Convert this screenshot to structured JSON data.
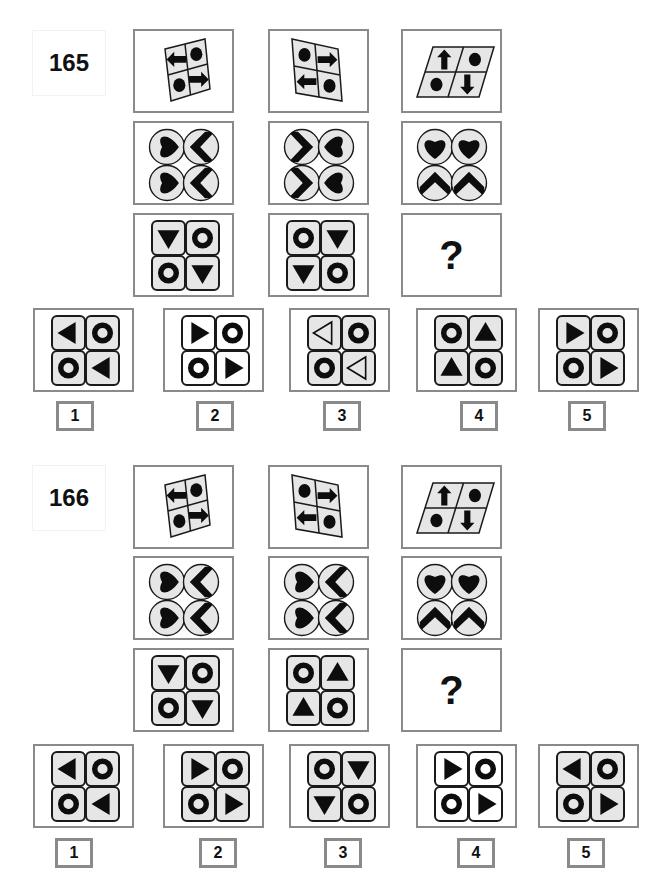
{
  "colors": {
    "frame_border": "#8a8a8a",
    "tile_fill_gray": "#e6e6e6",
    "tile_fill_white": "#ffffff",
    "shape_fill": "#0d0d0d",
    "outline": "#1a1a1a"
  },
  "puzzles": [
    {
      "number": "165",
      "question_mark": "?",
      "grid": [
        [
          {
            "type": "parallelogram-grid",
            "skew": "left-tilt",
            "cells": [
              "arrow-left",
              "dot",
              "dot",
              "arrow-right"
            ]
          },
          {
            "type": "parallelogram-grid",
            "skew": "right-tilt",
            "cells": [
              "dot",
              "arrow-right",
              "arrow-left",
              "dot"
            ]
          },
          {
            "type": "parallelogram-grid",
            "skew": "slant",
            "cells": [
              "arrow-up",
              "dot",
              "dot",
              "arrow-down"
            ]
          }
        ],
        [
          {
            "type": "circle-grid",
            "cells": [
              "heart-right",
              "chevron-left",
              "heart-right",
              "chevron-left"
            ]
          },
          {
            "type": "circle-grid",
            "cells": [
              "chevron-right",
              "heart-left",
              "chevron-right",
              "heart-left"
            ]
          },
          {
            "type": "circle-grid",
            "cells": [
              "heart-up",
              "heart-up",
              "chevron-up",
              "chevron-up"
            ]
          }
        ],
        [
          {
            "type": "tile-grid",
            "fill": "gray",
            "cells": [
              "tri-down",
              "ring",
              "ring",
              "tri-down"
            ]
          },
          {
            "type": "tile-grid",
            "fill": "gray",
            "cells": [
              "ring",
              "tri-down",
              "tri-down",
              "ring"
            ]
          },
          {
            "type": "question"
          }
        ]
      ],
      "options": [
        {
          "label": "1",
          "fill": "gray",
          "cells": [
            "tri-left",
            "ring",
            "ring",
            "tri-left"
          ]
        },
        {
          "label": "2",
          "fill": "white",
          "cells": [
            "tri-right",
            "ring",
            "ring",
            "tri-right"
          ]
        },
        {
          "label": "3",
          "fill": "gray",
          "cells": [
            "tri-left-outline",
            "ring",
            "ring",
            "tri-left-outline"
          ]
        },
        {
          "label": "4",
          "fill": "gray",
          "cells": [
            "ring",
            "tri-up",
            "tri-up",
            "ring"
          ]
        },
        {
          "label": "5",
          "fill": "gray",
          "cells": [
            "tri-right",
            "ring",
            "ring",
            "tri-right"
          ]
        }
      ]
    },
    {
      "number": "166",
      "question_mark": "?",
      "grid": [
        [
          {
            "type": "parallelogram-grid",
            "skew": "left-tilt",
            "cells": [
              "arrow-left",
              "dot",
              "dot",
              "arrow-right"
            ]
          },
          {
            "type": "parallelogram-grid",
            "skew": "right-tilt",
            "cells": [
              "dot",
              "arrow-right",
              "arrow-left",
              "dot"
            ]
          },
          {
            "type": "parallelogram-grid",
            "skew": "slant",
            "cells": [
              "arrow-up",
              "dot",
              "dot",
              "arrow-down"
            ]
          }
        ],
        [
          {
            "type": "circle-grid",
            "cells": [
              "heart-right",
              "chevron-left",
              "heart-right",
              "chevron-left"
            ]
          },
          {
            "type": "circle-grid",
            "cells": [
              "heart-right",
              "chevron-left",
              "heart-right",
              "chevron-left"
            ]
          },
          {
            "type": "circle-grid",
            "cells": [
              "heart-up",
              "heart-up",
              "chevron-up",
              "chevron-up"
            ]
          }
        ],
        [
          {
            "type": "tile-grid",
            "fill": "gray",
            "cells": [
              "tri-down",
              "ring",
              "ring",
              "tri-down"
            ]
          },
          {
            "type": "tile-grid",
            "fill": "gray",
            "cells": [
              "ring",
              "tri-up",
              "tri-up",
              "ring"
            ]
          },
          {
            "type": "question"
          }
        ]
      ],
      "options": [
        {
          "label": "1",
          "fill": "gray",
          "cells": [
            "tri-left",
            "ring",
            "ring",
            "tri-left"
          ]
        },
        {
          "label": "2",
          "fill": "gray",
          "cells": [
            "tri-right",
            "ring",
            "ring",
            "tri-right"
          ]
        },
        {
          "label": "3",
          "fill": "gray",
          "cells": [
            "ring",
            "tri-down",
            "tri-down",
            "ring"
          ]
        },
        {
          "label": "4",
          "fill": "white",
          "cells": [
            "tri-right",
            "ring",
            "ring",
            "tri-right"
          ]
        },
        {
          "label": "5",
          "fill": "gray",
          "cells": [
            "tri-left",
            "ring",
            "ring",
            "tri-right"
          ]
        }
      ]
    }
  ]
}
